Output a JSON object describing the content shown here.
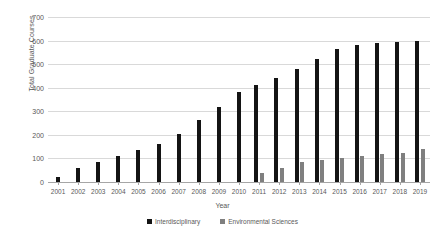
{
  "chart_data": {
    "type": "bar",
    "title": "",
    "xlabel": "Year",
    "ylabel": "Total Graduate Courses",
    "categories": [
      "2001",
      "2002",
      "2003",
      "2004",
      "2005",
      "2006",
      "2007",
      "2008",
      "2009",
      "2010",
      "2011",
      "2012",
      "2013",
      "2014",
      "2015",
      "2016",
      "2017",
      "2018",
      "2019"
    ],
    "series": [
      {
        "name": "Interdisciplinary",
        "color": "#141414",
        "values": [
          20,
          60,
          85,
          110,
          135,
          160,
          205,
          265,
          320,
          380,
          410,
          440,
          480,
          520,
          565,
          580,
          590,
          595,
          600
        ]
      },
      {
        "name": "Environmental Sciences",
        "color": "#7f7f7f",
        "values": [
          0,
          0,
          0,
          0,
          0,
          0,
          0,
          0,
          0,
          0,
          40,
          60,
          85,
          95,
          100,
          110,
          120,
          125,
          140
        ]
      }
    ],
    "ylim": [
      0,
      700
    ],
    "yticks": [
      0,
      100,
      200,
      300,
      400,
      500,
      600,
      700
    ],
    "grid": true,
    "legend_position": "bottom"
  },
  "axes": {
    "y_title": "Total Graduate Courses",
    "x_title": "Year"
  },
  "legend": {
    "items": [
      {
        "label": "Interdisciplinary",
        "color": "#141414"
      },
      {
        "label": "Environmental Sciences",
        "color": "#7f7f7f"
      }
    ]
  },
  "colors": {
    "series_a": "#141414",
    "series_b": "#7f7f7f",
    "gridline": "#d9d9d9",
    "text": "#595959",
    "background": "#ffffff"
  }
}
